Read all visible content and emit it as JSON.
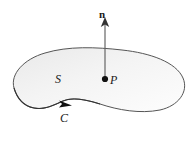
{
  "figure": {
    "background_color": "#ffffff",
    "surface": {
      "name": "S",
      "label": "S",
      "fill_color": "#f2f2f2",
      "stroke_color": "#555555",
      "stroke_width": 1
    },
    "boundary": {
      "name": "C",
      "label": "C",
      "stroke_color": "#333333",
      "direction": "counterclockwise",
      "arrow_marker": "triangle-right"
    },
    "normal_vector": {
      "name": "n",
      "label": "n",
      "style": "bold",
      "stroke_color": "#666666",
      "arrow_marker": "triangle-up",
      "base_x": 105,
      "base_y": 79,
      "tip_x": 105,
      "tip_y": 22
    },
    "point": {
      "name": "P",
      "label": "P",
      "x": 105,
      "y": 79,
      "dot_color": "#111111",
      "dot_radius": 3.1
    }
  }
}
